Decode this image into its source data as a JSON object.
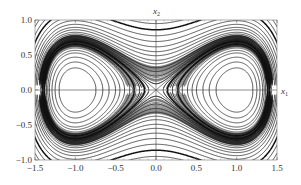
{
  "chart_data": {
    "type": "line",
    "subtype": "phase-portrait",
    "title": "",
    "xlabel": "x1",
    "ylabel": "x2",
    "xlim": [
      -1.5,
      1.5
    ],
    "ylim": [
      -1.0,
      1.0
    ],
    "xticks": [
      -1.5,
      -1.0,
      -0.5,
      0.0,
      0.5,
      1.0,
      1.5
    ],
    "xtick_labels": [
      "−1.5",
      "−1.0",
      "−0.5",
      "0.0",
      "0.5",
      "1.0",
      "1.5"
    ],
    "yticks": [
      -1.0,
      -0.5,
      0.0,
      0.5,
      1.0
    ],
    "ytick_labels": [
      "−1.0",
      "−0.5",
      "0.0",
      "0.5",
      "1.0"
    ],
    "grid": false,
    "legend": null,
    "axes_through_origin": true,
    "features": {
      "centers": [
        [
          -1.0,
          0.0
        ],
        [
          1.0,
          0.0
        ]
      ],
      "saddle": [
        0.0,
        0.0
      ],
      "separatrix": "figure-eight homoclinic loops through origin"
    },
    "line_color": "#111111",
    "frame_color": "#555555",
    "trajectory_levels_inside_wells": [
      -0.2,
      -0.17,
      -0.14,
      -0.11,
      -0.09,
      -0.07,
      -0.05,
      -0.035,
      -0.02,
      -0.01,
      -0.004
    ],
    "trajectory_levels_outside": [
      0.004,
      0.01,
      0.02,
      0.035,
      0.05,
      0.07,
      0.09,
      0.12,
      0.15,
      0.19,
      0.24,
      0.3,
      0.37,
      0.45,
      0.55,
      0.67,
      0.8,
      0.95,
      1.12,
      1.3
    ]
  }
}
